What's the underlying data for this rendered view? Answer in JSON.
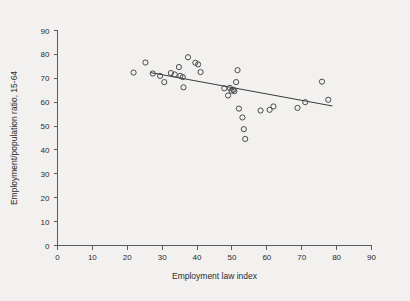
{
  "chart_data": {
    "type": "scatter",
    "title": "",
    "xlabel": "Employment law index",
    "ylabel": "Employment/population ratio, 15-64",
    "xlim": [
      0,
      90
    ],
    "ylim": [
      0,
      90
    ],
    "xticks": [
      0,
      10,
      20,
      30,
      40,
      50,
      60,
      70,
      80,
      90
    ],
    "yticks": [
      0,
      10,
      20,
      30,
      40,
      50,
      60,
      70,
      80,
      90
    ],
    "grid": false,
    "legend": null,
    "marker": "open-circle",
    "marker_color": "#4a4a4a",
    "background_color": "#f2f1ef",
    "points": [
      {
        "x": 21.8,
        "y": 72.4
      },
      {
        "x": 25.2,
        "y": 76.6
      },
      {
        "x": 27.3,
        "y": 72.0
      },
      {
        "x": 29.4,
        "y": 71.0
      },
      {
        "x": 30.6,
        "y": 68.4
      },
      {
        "x": 32.5,
        "y": 72.2
      },
      {
        "x": 33.6,
        "y": 71.6
      },
      {
        "x": 34.8,
        "y": 74.7
      },
      {
        "x": 35.2,
        "y": 71.0
      },
      {
        "x": 35.9,
        "y": 70.5
      },
      {
        "x": 36.1,
        "y": 66.2
      },
      {
        "x": 37.4,
        "y": 78.8
      },
      {
        "x": 39.5,
        "y": 76.5
      },
      {
        "x": 40.3,
        "y": 75.8
      },
      {
        "x": 41.0,
        "y": 72.6
      },
      {
        "x": 47.8,
        "y": 65.8
      },
      {
        "x": 48.9,
        "y": 62.8
      },
      {
        "x": 49.4,
        "y": 66.0
      },
      {
        "x": 49.9,
        "y": 64.8
      },
      {
        "x": 50.4,
        "y": 65.2
      },
      {
        "x": 50.7,
        "y": 64.6
      },
      {
        "x": 51.2,
        "y": 68.4
      },
      {
        "x": 51.6,
        "y": 73.4
      },
      {
        "x": 52.0,
        "y": 57.3
      },
      {
        "x": 53.0,
        "y": 53.6
      },
      {
        "x": 53.4,
        "y": 48.7
      },
      {
        "x": 53.8,
        "y": 44.6
      },
      {
        "x": 58.2,
        "y": 56.5
      },
      {
        "x": 60.8,
        "y": 56.8
      },
      {
        "x": 61.9,
        "y": 58.2
      },
      {
        "x": 68.8,
        "y": 57.6
      },
      {
        "x": 71.0,
        "y": 60.0
      },
      {
        "x": 75.8,
        "y": 68.6
      },
      {
        "x": 77.6,
        "y": 61.0
      }
    ],
    "fit_line": {
      "x_start": 26.6,
      "y_start": 72.4,
      "x_end": 78.8,
      "y_end": 58.4
    }
  }
}
